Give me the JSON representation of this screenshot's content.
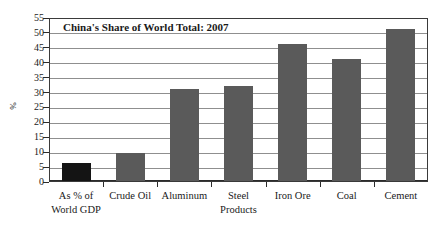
{
  "chart_data": {
    "type": "bar",
    "title": "China's Share of World Total: 2007",
    "xlabel": "",
    "ylabel": "%",
    "ylim": [
      0,
      55
    ],
    "yticks": [
      0,
      5,
      10,
      15,
      20,
      25,
      30,
      35,
      40,
      45,
      50,
      55
    ],
    "grid": true,
    "legend": "none",
    "categories": [
      "As % of World GDP",
      "Crude Oil",
      "Aluminum",
      "Steel Products",
      "Iron Ore",
      "Coal",
      "Cement"
    ],
    "category_lines": [
      [
        "As % of",
        "World GDP"
      ],
      [
        "Crude Oil"
      ],
      [
        "Aluminum"
      ],
      [
        "Steel",
        "Products"
      ],
      [
        "Iron Ore"
      ],
      [
        "Coal"
      ],
      [
        "Cement"
      ]
    ],
    "values": [
      6.0,
      9.3,
      31.0,
      32.0,
      46.0,
      41.0,
      51.0
    ],
    "bar_colors": [
      "#141414",
      "#5a5a5a",
      "#5a5a5a",
      "#5a5a5a",
      "#5a5a5a",
      "#5a5a5a",
      "#5a5a5a"
    ],
    "colors": {
      "accent_bar": "#141414",
      "bar": "#5a5a5a",
      "gridline": "#8f8f8f",
      "axis": "#2b2b2b",
      "background": "#ffffff",
      "text": "#1a1a1a"
    }
  }
}
